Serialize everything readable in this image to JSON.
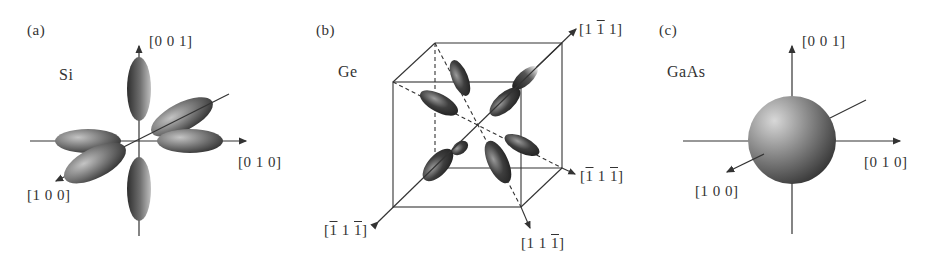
{
  "figure": {
    "panels": [
      {
        "tag": "(a)",
        "material": "Si",
        "surface_shape": "six ellipsoids along <100>",
        "axes": {
          "z": "[0 0 1]",
          "y": "[0 1 0]",
          "x": "[1 0 0]"
        }
      },
      {
        "tag": "(b)",
        "material": "Ge",
        "surface_shape": "ellipsoids along <111> in cube",
        "axes": {
          "d1": {
            "open": "[1 ",
            "bar": "1",
            "close": " 1]"
          },
          "d2": {
            "open": "[",
            "bar1": "1",
            "mid": " 1 ",
            "bar2": "1",
            "close": "]"
          },
          "d3": {
            "open": "[",
            "bar1": "1",
            "mid": " 1 ",
            "bar2": "1",
            "close": "]"
          },
          "d4": {
            "open": "[1 1 ",
            "bar": "1",
            "close": "]"
          }
        }
      },
      {
        "tag": "(c)",
        "material": "GaAs",
        "surface_shape": "sphere at Γ",
        "axes": {
          "z": "[0 0 1]",
          "y": "[0 1 0]",
          "x": "[1 0 0]"
        }
      }
    ],
    "colors": {
      "line": "#333333",
      "shade_dark": "#2a2a2a",
      "shade_light": "#b8b8b8",
      "background": "#ffffff"
    }
  }
}
